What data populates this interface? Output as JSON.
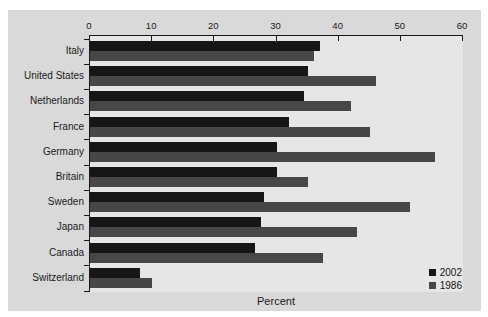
{
  "chart_data": {
    "type": "bar",
    "orientation": "horizontal",
    "title": "",
    "xlabel": "Percent",
    "xlim": [
      0,
      60
    ],
    "x_ticks": [
      0,
      10,
      20,
      30,
      40,
      50,
      60
    ],
    "grid": false,
    "legend_position": "bottom-right",
    "categories": [
      "Italy",
      "United States",
      "Netherlands",
      "France",
      "Germany",
      "Britain",
      "Sweden",
      "Japan",
      "Canada",
      "Switzerland"
    ],
    "series": [
      {
        "name": "2002",
        "color": "#161616",
        "values": [
          37,
          35,
          34.5,
          32,
          30,
          30,
          28,
          27.5,
          26.5,
          8
        ]
      },
      {
        "name": "1986",
        "color": "#474747",
        "values": [
          36,
          46,
          42,
          45,
          55.5,
          35,
          51.5,
          43,
          37.5,
          10
        ]
      }
    ],
    "colors": {
      "panel_bg": "#d9d9d9",
      "plot_bg": "#e6e6e6",
      "axis": "#1a1a1a"
    }
  }
}
